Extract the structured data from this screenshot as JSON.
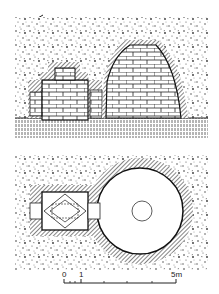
{
  "figure": {
    "type": "architectural drawing",
    "views": [
      {
        "name": "section",
        "description": "Elevation/section of tomb with antechamber and corbelled dome"
      },
      {
        "name": "plan",
        "description": "Plan of tomb with rectangular antechamber and circular chamber"
      }
    ]
  },
  "scale_bar": {
    "labels": [
      "0",
      "1",
      "5m"
    ],
    "start": 0,
    "end": 5,
    "unit": "m"
  },
  "colors": {
    "ink": "#1a1a1a",
    "paper": "#ffffff",
    "hatch": "#555555",
    "stipple": "#3a3a3a"
  }
}
